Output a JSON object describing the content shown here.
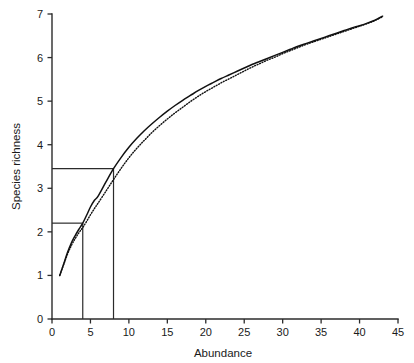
{
  "chart_data": {
    "type": "line",
    "title": "",
    "xlabel": "Abundance",
    "ylabel": "Species richness",
    "xlim": [
      0,
      45
    ],
    "ylim": [
      0,
      7
    ],
    "xticks": [
      0,
      5,
      10,
      15,
      20,
      25,
      30,
      35,
      40,
      45
    ],
    "yticks": [
      0,
      1,
      2,
      3,
      4,
      5,
      6,
      7
    ],
    "xtick_labels": [
      "0",
      "5",
      "10",
      "15",
      "20",
      "25",
      "30",
      "35",
      "40",
      "45"
    ],
    "ytick_labels": [
      "0",
      "1",
      "2",
      "3",
      "4",
      "5",
      "6",
      "7"
    ],
    "grid": false,
    "legend": null,
    "series": [
      {
        "name": "solid-rarefaction-curve",
        "style": "solid",
        "color": "#111111",
        "x": [
          1,
          1.5,
          2,
          2.5,
          3,
          3.5,
          4,
          4.5,
          5,
          5.5,
          6,
          7,
          8,
          9,
          10,
          11,
          12,
          13,
          14,
          15,
          16,
          17,
          18,
          19,
          20,
          21,
          22,
          23,
          24,
          25,
          26,
          27,
          28,
          29,
          30,
          31,
          32,
          33,
          34,
          35,
          36,
          37,
          38,
          39,
          40,
          41,
          42,
          43
        ],
        "y": [
          1.0,
          1.25,
          1.52,
          1.74,
          1.91,
          2.06,
          2.2,
          2.38,
          2.57,
          2.72,
          2.82,
          3.14,
          3.45,
          3.71,
          3.94,
          4.14,
          4.32,
          4.48,
          4.63,
          4.77,
          4.9,
          5.02,
          5.13,
          5.24,
          5.34,
          5.43,
          5.52,
          5.6,
          5.68,
          5.76,
          5.84,
          5.91,
          5.98,
          6.05,
          6.12,
          6.19,
          6.26,
          6.32,
          6.38,
          6.44,
          6.5,
          6.56,
          6.62,
          6.68,
          6.73,
          6.79,
          6.86,
          6.95
        ]
      },
      {
        "name": "dotted-rarefaction-curve",
        "style": "dotted",
        "color": "#111111",
        "x": [
          1,
          1.5,
          2,
          2.5,
          3,
          3.5,
          4,
          4.5,
          5,
          5.5,
          6,
          7,
          8,
          9,
          10,
          11,
          12,
          13,
          14,
          15,
          16,
          17,
          18,
          19,
          20,
          21,
          22,
          23,
          24,
          25,
          26,
          27,
          28,
          29,
          30,
          31,
          32,
          33,
          34,
          35,
          36,
          37,
          38,
          39,
          40,
          41,
          42,
          43
        ],
        "y": [
          1.0,
          1.24,
          1.48,
          1.68,
          1.84,
          1.98,
          2.1,
          2.24,
          2.39,
          2.53,
          2.66,
          2.93,
          3.2,
          3.46,
          3.7,
          3.91,
          4.1,
          4.28,
          4.44,
          4.59,
          4.73,
          4.86,
          4.99,
          5.11,
          5.22,
          5.32,
          5.42,
          5.51,
          5.6,
          5.69,
          5.78,
          5.86,
          5.94,
          6.01,
          6.09,
          6.16,
          6.23,
          6.3,
          6.36,
          6.42,
          6.48,
          6.54,
          6.6,
          6.66,
          6.72,
          6.78,
          6.85,
          6.94
        ]
      }
    ],
    "reference_lines": [
      {
        "name": "reference-marker-low",
        "x": 4,
        "y": 2.2
      },
      {
        "name": "reference-marker-high",
        "x": 8,
        "y": 3.45
      }
    ]
  }
}
